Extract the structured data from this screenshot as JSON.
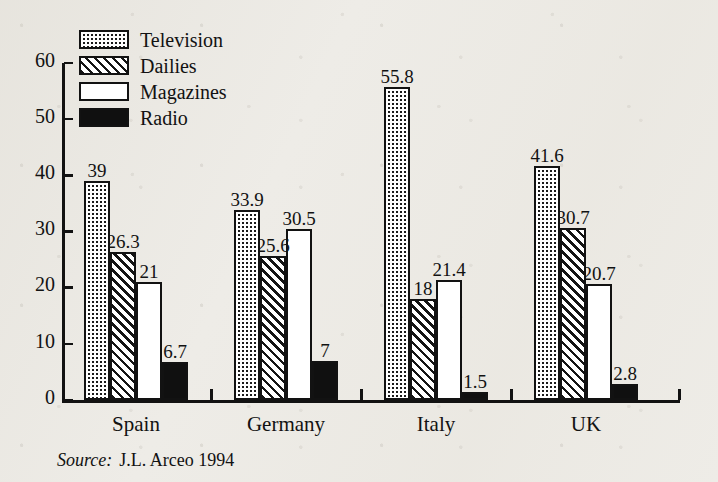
{
  "chart_data": {
    "type": "bar",
    "title": "",
    "subtitle": "",
    "xlabel": "",
    "ylabel": "",
    "ylim": [
      0,
      60
    ],
    "yticks": [
      0,
      10,
      20,
      30,
      40,
      50,
      60
    ],
    "grid": false,
    "legend_position": "top-left",
    "categories": [
      "Spain",
      "Germany",
      "Italy",
      "UK"
    ],
    "series": [
      {
        "name": "Television",
        "pattern": "dotted",
        "values": [
          39,
          33.9,
          55.8,
          41.6
        ]
      },
      {
        "name": "Dailies",
        "pattern": "hatched",
        "values": [
          26.3,
          25.6,
          18,
          30.7
        ]
      },
      {
        "name": "Magazines",
        "pattern": "white",
        "values": [
          21,
          30.5,
          21.4,
          20.7
        ]
      },
      {
        "name": "Radio",
        "pattern": "solid",
        "values": [
          6.7,
          7,
          1.5,
          2.8
        ]
      }
    ],
    "value_labels": [
      [
        "39",
        "26.3",
        "21",
        "6.7"
      ],
      [
        "33.9",
        "25.6",
        "30.5",
        "7"
      ],
      [
        "55.8",
        "18",
        "21.4",
        "1.5"
      ],
      [
        "41.6",
        "30.7",
        "20.7",
        "2.8"
      ]
    ]
  },
  "legend": {
    "items": [
      {
        "label": "Television",
        "pattern": "dotted"
      },
      {
        "label": "Dailies",
        "pattern": "hatched"
      },
      {
        "label": "Magazines",
        "pattern": "white"
      },
      {
        "label": "Radio",
        "pattern": "solid"
      }
    ]
  },
  "axis": {
    "y_tick_labels": [
      "60",
      "50",
      "40",
      "30",
      "20",
      "10",
      "0"
    ],
    "x_tick_labels": [
      "Spain",
      "Germany",
      "Italy",
      "UK"
    ]
  },
  "source": {
    "prefix": "Source:",
    "text": "J.L. Arceo 1994"
  },
  "colors": {
    "ink": "#121212",
    "paper": "#eeece7",
    "bar_fill": "#ffffff",
    "radio_fill": "#101010"
  }
}
